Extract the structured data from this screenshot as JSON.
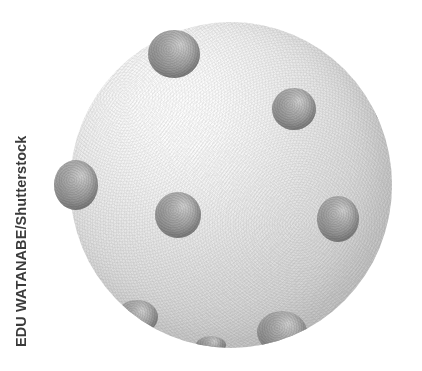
{
  "image": {
    "subject": "virus-particle-illustration",
    "background_color": "#ffffff",
    "canvas": {
      "width": 422,
      "height": 371
    }
  },
  "credit": {
    "text": "EDU WATANABE/Shutterstock",
    "photographer": "EDU WATANABE",
    "agency": "Shutterstock",
    "orientation": "vertical-rotated-90-ccw",
    "color": "#3b3b3b"
  },
  "illustration": {
    "main_body": {
      "label": "virus-capsid",
      "shape": "sphere",
      "center_x": 231,
      "center_y": 185,
      "width": 322,
      "height": 326,
      "surface_color": "#e0e0e0",
      "highlight_color": "#fdfdfd",
      "shadow_color": "#cdcdcd",
      "texture": "grainy-stippled"
    },
    "receptors": {
      "label": "surface-spike-proteins",
      "count": 9,
      "base_color": "#9b9b9b",
      "highlight_color": "#cfcfcf",
      "shadow_color": "#7c7c7c",
      "items": [
        {
          "name": "receptor-top-left",
          "x": 148,
          "y": 30,
          "w": 52,
          "h": 48,
          "clipped": false
        },
        {
          "name": "receptor-top-right",
          "x": 272,
          "y": 88,
          "w": 44,
          "h": 42,
          "clipped": false
        },
        {
          "name": "receptor-right-edge",
          "x": 374,
          "y": 86,
          "w": 26,
          "h": 38,
          "clipped": true
        },
        {
          "name": "receptor-left-edge",
          "x": 54,
          "y": 160,
          "w": 44,
          "h": 50,
          "clipped": false
        },
        {
          "name": "receptor-center",
          "x": 155,
          "y": 192,
          "w": 46,
          "h": 46,
          "clipped": false
        },
        {
          "name": "receptor-mid-right",
          "x": 317,
          "y": 196,
          "w": 42,
          "h": 46,
          "clipped": false
        },
        {
          "name": "receptor-bottom-left",
          "x": 116,
          "y": 300,
          "w": 42,
          "h": 34,
          "clipped": true
        },
        {
          "name": "receptor-bottom-right",
          "x": 257,
          "y": 311,
          "w": 50,
          "h": 42,
          "clipped": true
        },
        {
          "name": "receptor-lower-mid",
          "x": 196,
          "y": 336,
          "w": 30,
          "h": 18,
          "clipped": true
        }
      ]
    }
  }
}
